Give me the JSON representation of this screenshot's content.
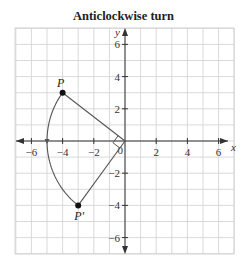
{
  "title": "Anticlockwise turn",
  "axes": {
    "x_label": "x",
    "y_label": "y",
    "x_range": [
      -7,
      7
    ],
    "y_range": [
      -7,
      7
    ],
    "x_ticks": [
      -6,
      -4,
      -2,
      2,
      4,
      6
    ],
    "y_ticks": [
      -6,
      -4,
      -2,
      2,
      4,
      6
    ],
    "origin_label": "0"
  },
  "grid": {
    "visible": true,
    "step": 1
  },
  "rotation": {
    "direction": "anticlockwise",
    "angle_degrees": 90,
    "center": [
      0,
      0
    ]
  },
  "points": [
    {
      "id": "P",
      "label": "P",
      "x": -4,
      "y": 3
    },
    {
      "id": "P_prime",
      "label": "P'",
      "x": -3,
      "y": -4
    }
  ],
  "colors": {
    "grid": "#d0d0d0",
    "axis": "#333333",
    "construction": "#555555",
    "point": "#111111"
  }
}
